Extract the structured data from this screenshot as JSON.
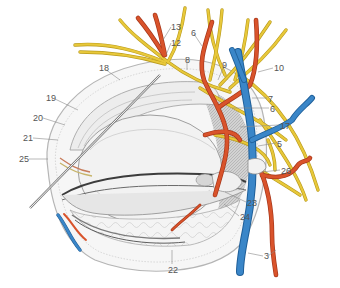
{
  "figure": {
    "type": "anatomical-illustration",
    "colors": {
      "nerve": "#e8c83a",
      "nerve_outline": "#b89a1c",
      "artery": "#d9532b",
      "artery_outline": "#a5361a",
      "vein": "#3a86c8",
      "vein_outline": "#1f5f99",
      "tissue_gray": "#a8a8a8",
      "tissue_light": "#ececec",
      "leader_line": "#8a8a8a",
      "label_text": "#555555"
    }
  },
  "labels": [
    {
      "id": "13",
      "text": "13",
      "x": 171,
      "y": 22
    },
    {
      "id": "12",
      "text": "12",
      "x": 171,
      "y": 38
    },
    {
      "id": "6a",
      "text": "6",
      "x": 191,
      "y": 28
    },
    {
      "id": "8",
      "text": "8",
      "x": 185,
      "y": 55
    },
    {
      "id": "9",
      "text": "9",
      "x": 222,
      "y": 60
    },
    {
      "id": "10",
      "text": "10",
      "x": 274,
      "y": 63
    },
    {
      "id": "7",
      "text": "7",
      "x": 268,
      "y": 94
    },
    {
      "id": "6b",
      "text": "6",
      "x": 270,
      "y": 104
    },
    {
      "id": "17",
      "text": "17",
      "x": 280,
      "y": 121
    },
    {
      "id": "5",
      "text": "5",
      "x": 277,
      "y": 139
    },
    {
      "id": "26",
      "text": "26",
      "x": 281,
      "y": 166
    },
    {
      "id": "23",
      "text": "23",
      "x": 247,
      "y": 198
    },
    {
      "id": "24",
      "text": "24",
      "x": 240,
      "y": 212
    },
    {
      "id": "3",
      "text": "3",
      "x": 264,
      "y": 251
    },
    {
      "id": "22",
      "text": "22",
      "x": 168,
      "y": 265
    },
    {
      "id": "18",
      "text": "18",
      "x": 99,
      "y": 63
    },
    {
      "id": "19",
      "text": "19",
      "x": 46,
      "y": 93
    },
    {
      "id": "20",
      "text": "20",
      "x": 33,
      "y": 113
    },
    {
      "id": "21",
      "text": "21",
      "x": 23,
      "y": 133
    },
    {
      "id": "25",
      "text": "25",
      "x": 19,
      "y": 154
    }
  ]
}
